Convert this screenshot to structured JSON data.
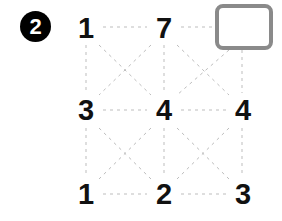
{
  "badge": {
    "label": "2",
    "bg_color": "#000000",
    "text_color": "#ffffff"
  },
  "puzzle": {
    "type": "number-lattice-grid",
    "rows": 3,
    "cols": 3,
    "grid": [
      [
        "1",
        "7",
        ""
      ],
      [
        "3",
        "4",
        "4"
      ],
      [
        "1",
        "2",
        "3"
      ]
    ],
    "cells": [
      {
        "id": "cell-r0c0",
        "row": 0,
        "col": 0,
        "value": "1",
        "kind": "number",
        "x": 86,
        "y": 28
      },
      {
        "id": "cell-r0c1",
        "row": 0,
        "col": 1,
        "value": "7",
        "kind": "number",
        "x": 164,
        "y": 28
      },
      {
        "id": "cell-r0c2",
        "row": 0,
        "col": 2,
        "value": "",
        "kind": "answer-box",
        "x": 243,
        "y": 26
      },
      {
        "id": "cell-r1c0",
        "row": 1,
        "col": 0,
        "value": "3",
        "kind": "number",
        "x": 86,
        "y": 110
      },
      {
        "id": "cell-r1c1",
        "row": 1,
        "col": 1,
        "value": "4",
        "kind": "number",
        "x": 164,
        "y": 110
      },
      {
        "id": "cell-r1c2",
        "row": 1,
        "col": 2,
        "value": "4",
        "kind": "number",
        "x": 243,
        "y": 110
      },
      {
        "id": "cell-r2c0",
        "row": 2,
        "col": 0,
        "value": "1",
        "kind": "number",
        "x": 86,
        "y": 194
      },
      {
        "id": "cell-r2c1",
        "row": 2,
        "col": 1,
        "value": "2",
        "kind": "number",
        "x": 164,
        "y": 194
      },
      {
        "id": "cell-r2c2",
        "row": 2,
        "col": 2,
        "value": "3",
        "kind": "number",
        "x": 243,
        "y": 194
      }
    ],
    "answer_box": {
      "id": "answer-box",
      "value": "",
      "border_color": "#8a8a8a",
      "fill_color": "#ffffff",
      "left": 215,
      "top": 4,
      "width": 50,
      "height": 38,
      "corner_radius": 8
    },
    "connector_style": {
      "color": "#bdbdbd",
      "dash": "3 4",
      "width": 1
    },
    "connectors": {
      "horizontal": [
        {
          "from": "cell-r0c0",
          "to": "cell-r0c1"
        },
        {
          "from": "cell-r0c1",
          "to": "answer-box"
        },
        {
          "from": "cell-r1c0",
          "to": "cell-r1c1"
        },
        {
          "from": "cell-r1c1",
          "to": "cell-r1c2"
        },
        {
          "from": "cell-r2c0",
          "to": "cell-r2c1"
        },
        {
          "from": "cell-r2c1",
          "to": "cell-r2c2"
        }
      ],
      "vertical": [
        {
          "from": "cell-r0c0",
          "to": "cell-r1c0"
        },
        {
          "from": "cell-r0c1",
          "to": "cell-r1c1"
        },
        {
          "from": "answer-box",
          "to": "cell-r1c2"
        },
        {
          "from": "cell-r1c0",
          "to": "cell-r2c0"
        },
        {
          "from": "cell-r1c1",
          "to": "cell-r2c1"
        },
        {
          "from": "cell-r1c2",
          "to": "cell-r2c2"
        }
      ],
      "diagonal": [
        {
          "from": "cell-r0c0",
          "to": "cell-r1c1"
        },
        {
          "from": "cell-r0c1",
          "to": "cell-r1c0"
        },
        {
          "from": "cell-r0c1",
          "to": "cell-r1c2"
        },
        {
          "from": "answer-box",
          "to": "cell-r1c1"
        },
        {
          "from": "cell-r1c0",
          "to": "cell-r2c1"
        },
        {
          "from": "cell-r1c1",
          "to": "cell-r2c0"
        },
        {
          "from": "cell-r1c1",
          "to": "cell-r2c2"
        },
        {
          "from": "cell-r1c2",
          "to": "cell-r2c1"
        }
      ]
    }
  }
}
